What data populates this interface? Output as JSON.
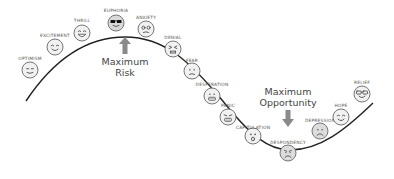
{
  "diagram": {
    "curve_color": "#222222",
    "arrow_color": "#8a8a8a",
    "callouts": [
      {
        "id": "max-risk",
        "lines": [
          "Maximum",
          "Risk"
        ],
        "x": 125,
        "y": 56,
        "arrow": "up",
        "arrow_x": 125,
        "arrow_y": 37
      },
      {
        "id": "max-opportunity",
        "lines": [
          "Maximum",
          "Opportunity"
        ],
        "x": 288,
        "y": 86,
        "arrow": "down",
        "arrow_x": 288,
        "arrow_y": 110
      }
    ],
    "stages": [
      {
        "label": "Optimism",
        "x": 30,
        "y": 70,
        "label_y": 56,
        "expression": "smile-flat"
      },
      {
        "label": "Excitement",
        "x": 55,
        "y": 47,
        "label_y": 33,
        "expression": "smile"
      },
      {
        "label": "Thrill",
        "x": 82,
        "y": 33,
        "label_y": 18,
        "expression": "grin"
      },
      {
        "label": "Euphoria",
        "x": 116,
        "y": 23,
        "label_y": 8,
        "expression": "sunglasses"
      },
      {
        "label": "Anxiety",
        "x": 146,
        "y": 29,
        "label_y": 15,
        "expression": "anxious"
      },
      {
        "label": "Denial",
        "x": 173,
        "y": 49,
        "label_y": 35,
        "expression": "squint"
      },
      {
        "label": "Fear",
        "x": 192,
        "y": 71,
        "label_y": 58,
        "expression": "worried"
      },
      {
        "label": "Desperation",
        "x": 212,
        "y": 96,
        "label_y": 82,
        "expression": "grimace"
      },
      {
        "label": "Panic",
        "x": 228,
        "y": 117,
        "label_y": 103,
        "expression": "panic"
      },
      {
        "label": "Capitulation",
        "x": 253,
        "y": 136,
        "label_y": 125,
        "expression": "shocked"
      },
      {
        "label": "Despondency",
        "x": 288,
        "y": 153,
        "label_y": 140,
        "expression": "sad"
      },
      {
        "label": "Depression",
        "x": 320,
        "y": 131,
        "label_y": 118,
        "expression": "frown"
      },
      {
        "label": "Hope",
        "x": 341,
        "y": 117,
        "label_y": 103,
        "expression": "smile"
      },
      {
        "label": "Relief",
        "x": 362,
        "y": 94,
        "label_y": 80,
        "expression": "glasses-smile"
      }
    ]
  }
}
